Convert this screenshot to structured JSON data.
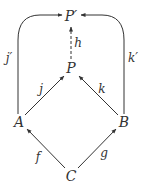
{
  "nodes": {
    "P_prime": {
      "label": "P′",
      "x": 71,
      "y": 18
    },
    "P": {
      "label": "P",
      "x": 71,
      "y": 68
    },
    "A": {
      "label": "A",
      "x": 19,
      "y": 122
    },
    "B": {
      "label": "B",
      "x": 124,
      "y": 122
    },
    "C": {
      "label": "C",
      "x": 71,
      "y": 175
    }
  },
  "edges": {
    "f": {
      "label": "f",
      "from": "C",
      "to": "A"
    },
    "g": {
      "label": "g",
      "from": "C",
      "to": "B"
    },
    "j": {
      "label": "j",
      "from": "A",
      "to": "P"
    },
    "k": {
      "label": "k",
      "from": "B",
      "to": "P"
    },
    "h": {
      "label": "h",
      "from": "P",
      "to": "P′",
      "style": "dashed"
    },
    "j_prime": {
      "label": "j′",
      "from": "A",
      "to": "P′",
      "style": "curved"
    },
    "k_prime": {
      "label": "k′",
      "from": "B",
      "to": "P′",
      "style": "curved"
    }
  },
  "colors": {
    "stroke": "#333333",
    "background": "#ffffff"
  }
}
